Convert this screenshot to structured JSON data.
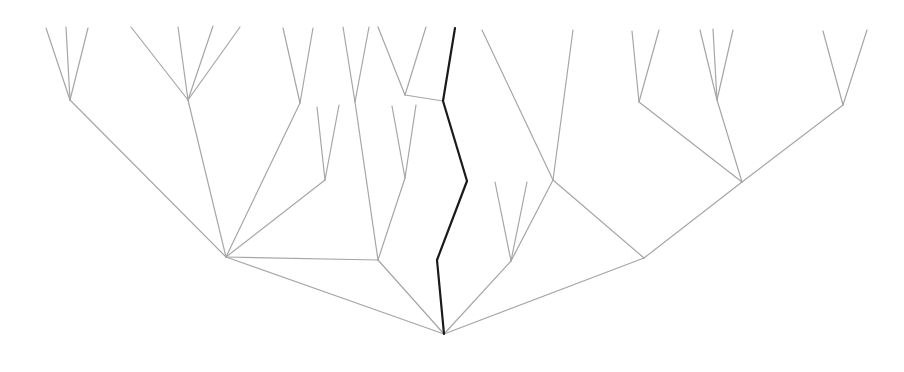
{
  "figure": {
    "width": 904,
    "height": 372,
    "background_color": "#ffffff"
  },
  "style": {
    "normal_branch_color": "#a6a6a6",
    "normal_branch_width": 1.2,
    "highlight_branch_color": "#1a1a1a",
    "highlight_branch_width": 2.2
  },
  "chart_data": {
    "type": "tree",
    "title": "",
    "xlabel": "",
    "ylabel": "",
    "orientation": "bottom-rooted-upward",
    "root": [
      444,
      334
    ],
    "grid": false,
    "legend": false,
    "normal_polylines": [
      [
        [
          444,
          334
        ],
        [
          226,
          257
        ]
      ],
      [
        [
          226,
          257
        ],
        [
          70,
          100
        ]
      ],
      [
        [
          70,
          100
        ],
        [
          46,
          28
        ]
      ],
      [
        [
          70,
          100
        ],
        [
          66,
          27
        ]
      ],
      [
        [
          70,
          100
        ],
        [
          88,
          28
        ]
      ],
      [
        [
          226,
          257
        ],
        [
          188,
          100
        ]
      ],
      [
        [
          188,
          100
        ],
        [
          131,
          27
        ]
      ],
      [
        [
          188,
          100
        ],
        [
          178,
          27
        ]
      ],
      [
        [
          188,
          100
        ],
        [
          213,
          26
        ]
      ],
      [
        [
          188,
          100
        ],
        [
          240,
          27
        ]
      ],
      [
        [
          226,
          257
        ],
        [
          300,
          103
        ]
      ],
      [
        [
          300,
          103
        ],
        [
          283,
          28
        ]
      ],
      [
        [
          300,
          103
        ],
        [
          313,
          28
        ]
      ],
      [
        [
          226,
          257
        ],
        [
          325,
          180
        ]
      ],
      [
        [
          325,
          180
        ],
        [
          317,
          107
        ]
      ],
      [
        [
          325,
          180
        ],
        [
          339,
          105
        ]
      ],
      [
        [
          226,
          257
        ],
        [
          378,
          260
        ]
      ],
      [
        [
          378,
          260
        ],
        [
          355,
          102
        ]
      ],
      [
        [
          355,
          102
        ],
        [
          343,
          27
        ]
      ],
      [
        [
          355,
          102
        ],
        [
          369,
          27
        ]
      ],
      [
        [
          378,
          260
        ],
        [
          405,
          178
        ]
      ],
      [
        [
          405,
          178
        ],
        [
          392,
          106
        ]
      ],
      [
        [
          405,
          178
        ],
        [
          416,
          105
        ]
      ],
      [
        [
          378,
          260
        ],
        [
          444,
          334
        ]
      ],
      [
        [
          405,
          95
        ],
        [
          378,
          27
        ]
      ],
      [
        [
          405,
          95
        ],
        [
          426,
          27
        ]
      ],
      [
        [
          405,
          95
        ],
        [
          443,
          101
        ]
      ],
      [
        [
          444,
          334
        ],
        [
          511,
          261
        ]
      ],
      [
        [
          511,
          261
        ],
        [
          495,
          182
        ]
      ],
      [
        [
          511,
          261
        ],
        [
          527,
          182
        ]
      ],
      [
        [
          511,
          261
        ],
        [
          553,
          180
        ]
      ],
      [
        [
          553,
          180
        ],
        [
          482,
          30
        ]
      ],
      [
        [
          553,
          180
        ],
        [
          573,
          30
        ]
      ],
      [
        [
          553,
          180
        ],
        [
          644,
          258
        ]
      ],
      [
        [
          644,
          258
        ],
        [
          742,
          182
        ]
      ],
      [
        [
          742,
          182
        ],
        [
          639,
          102
        ]
      ],
      [
        [
          639,
          102
        ],
        [
          632,
          31
        ]
      ],
      [
        [
          639,
          102
        ],
        [
          659,
          30
        ]
      ],
      [
        [
          742,
          182
        ],
        [
          717,
          100
        ]
      ],
      [
        [
          717,
          100
        ],
        [
          700,
          30
        ]
      ],
      [
        [
          717,
          100
        ],
        [
          713,
          29
        ]
      ],
      [
        [
          717,
          100
        ],
        [
          733,
          30
        ]
      ],
      [
        [
          742,
          182
        ],
        [
          843,
          105
        ]
      ],
      [
        [
          843,
          105
        ],
        [
          823,
          31
        ]
      ],
      [
        [
          843,
          105
        ],
        [
          867,
          30
        ]
      ],
      [
        [
          644,
          258
        ],
        [
          444,
          334
        ]
      ]
    ],
    "highlight_polyline": [
      [
        455,
        28
      ],
      [
        443,
        101
      ],
      [
        467,
        181
      ],
      [
        437,
        260
      ],
      [
        444,
        334
      ]
    ],
    "highlight_description": "dark path from a central leaf tip down to the root"
  }
}
